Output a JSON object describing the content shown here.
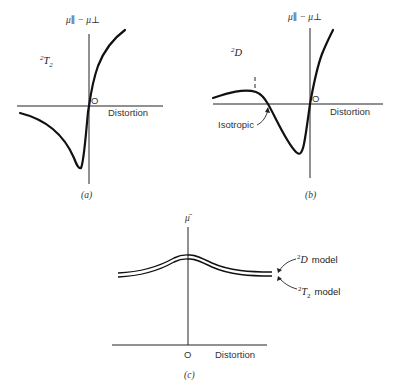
{
  "figure": {
    "panels": [
      {
        "id": "a",
        "caption": "(a)",
        "state_label": "2T2",
        "state_label_sup": "2",
        "state_label_main": "T",
        "state_label_sub": "2",
        "y_axis_label": "μ∥ − μ⊥",
        "x_axis_label": "Distortion",
        "origin_label": "O"
      },
      {
        "id": "b",
        "caption": "(b)",
        "state_label_sup": "2",
        "state_label_main": "D",
        "y_axis_label": "μ∥ − μ⊥",
        "x_axis_label": "Distortion",
        "origin_label": "O",
        "annotation": "Isotropic"
      },
      {
        "id": "c",
        "caption": "(c)",
        "y_axis_label": "μ̄",
        "x_axis_label": "Distortion",
        "origin_label": "O",
        "curve_labels": [
          {
            "sup": "2",
            "main": "D",
            "sub": "",
            "text": "model"
          },
          {
            "sup": "2",
            "main": "T",
            "sub": "2",
            "text": "model"
          }
        ]
      }
    ]
  },
  "colors": {
    "ink": "#111111",
    "text": "#333333",
    "background": "#ffffff"
  }
}
